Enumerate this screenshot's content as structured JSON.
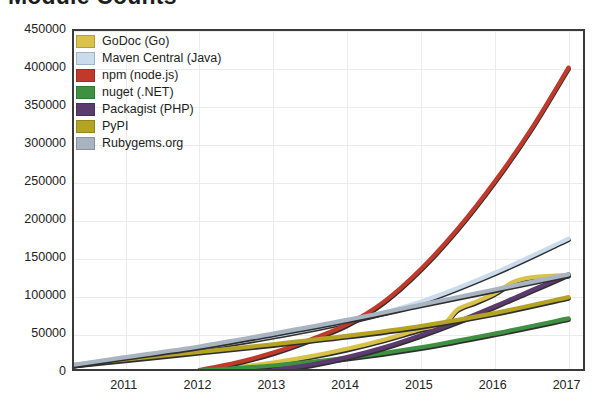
{
  "chart_data": {
    "type": "line",
    "title": "Module Counts",
    "xlabel": "",
    "ylabel": "",
    "xlim": [
      2010.3,
      2017.25
    ],
    "ylim": [
      0,
      450000
    ],
    "grid": true,
    "legend_position": "top-left",
    "x_ticks": [
      "2011",
      "2012",
      "2013",
      "2014",
      "2015",
      "2016",
      "2017"
    ],
    "y_ticks": [
      "0",
      "50000",
      "100000",
      "150000",
      "200000",
      "250000",
      "300000",
      "350000",
      "400000",
      "450000"
    ],
    "series": [
      {
        "name": "GoDoc (Go)",
        "color": "#d9c24a",
        "x": [
          2012.0,
          2012.5,
          2013.0,
          2013.5,
          2014.0,
          2014.5,
          2015.0,
          2015.3,
          2015.5,
          2015.75,
          2016.0,
          2016.25,
          2016.5,
          2017.0
        ],
        "values": [
          2000,
          6000,
          12000,
          20000,
          30000,
          42000,
          56000,
          62000,
          82000,
          92000,
          103000,
          118000,
          124000,
          127000
        ]
      },
      {
        "name": "Maven Central (Java)",
        "color": "#cadbec",
        "x": [
          2010.3,
          2011.0,
          2012.0,
          2013.0,
          2014.0,
          2015.0,
          2016.0,
          2017.0
        ],
        "values": [
          9000,
          18000,
          31000,
          47000,
          66000,
          92000,
          130000,
          175000
        ]
      },
      {
        "name": "npm (node.js)",
        "color": "#c0392b",
        "x": [
          2012.0,
          2012.5,
          2013.0,
          2013.5,
          2014.0,
          2014.5,
          2015.0,
          2015.5,
          2016.0,
          2016.5,
          2017.0
        ],
        "values": [
          2000,
          12000,
          25000,
          42000,
          62000,
          92000,
          135000,
          188000,
          250000,
          320000,
          400000
        ]
      },
      {
        "name": "nuget (.NET)",
        "color": "#3f9142",
        "x": [
          2012.0,
          2013.0,
          2014.0,
          2015.0,
          2016.0,
          2017.0
        ],
        "values": [
          1500,
          8000,
          18000,
          32000,
          50000,
          70000
        ]
      },
      {
        "name": "Packagist (PHP)",
        "color": "#5b3a6e",
        "x": [
          2013.0,
          2013.5,
          2014.0,
          2014.5,
          2015.0,
          2015.5,
          2016.0,
          2016.5,
          2017.0
        ],
        "values": [
          2000,
          9000,
          19000,
          32000,
          48000,
          66000,
          86000,
          107000,
          128000
        ]
      },
      {
        "name": "PyPI",
        "color": "#b5a424",
        "x": [
          2010.3,
          2011.0,
          2012.0,
          2013.0,
          2014.0,
          2015.0,
          2016.0,
          2017.0
        ],
        "values": [
          9000,
          16000,
          26000,
          36000,
          47000,
          60000,
          77000,
          98000
        ]
      },
      {
        "name": "Rubygems.org",
        "color": "#a8b4c2",
        "x": [
          2010.3,
          2011.0,
          2012.0,
          2013.0,
          2014.0,
          2015.0,
          2016.0,
          2017.0
        ],
        "values": [
          9000,
          19000,
          33000,
          50000,
          68000,
          88000,
          108000,
          128000
        ]
      }
    ]
  }
}
